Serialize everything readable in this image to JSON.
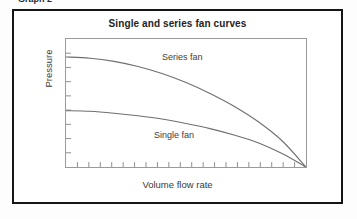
{
  "page": {
    "cut_off_caption": "Graph 2",
    "background_color": "#ffffff"
  },
  "figure": {
    "border_color": "#151515",
    "title": "Single and series fan curves"
  },
  "chart_data": {
    "type": "line",
    "title": "Single and series fan curves",
    "xlabel": "Volume flow rate",
    "ylabel": "Pressure",
    "grid": false,
    "legend_position": "inline-annotations",
    "axis_ticks_labeled": false,
    "x_tick_count": 20,
    "y_tick_count": 8,
    "xlim": [
      0,
      100
    ],
    "ylim": [
      0,
      100
    ],
    "line_color": "#6e6e6e",
    "annotations": [
      {
        "text": "Series fan",
        "x": 42,
        "y": 78
      },
      {
        "text": "Single fan",
        "x": 38,
        "y": 28
      }
    ],
    "series": [
      {
        "name": "Series fan",
        "x": [
          0,
          10,
          20,
          30,
          40,
          50,
          60,
          70,
          80,
          90,
          100
        ],
        "values": [
          86,
          85,
          82.5,
          78.5,
          73,
          66,
          57.5,
          47.5,
          35.5,
          20.5,
          0
        ]
      },
      {
        "name": "Single fan",
        "x": [
          0,
          10,
          20,
          30,
          40,
          50,
          60,
          70,
          80,
          90,
          100
        ],
        "values": [
          44,
          43.5,
          42,
          40,
          37.5,
          34,
          30,
          25,
          19,
          10.5,
          0
        ]
      }
    ]
  }
}
